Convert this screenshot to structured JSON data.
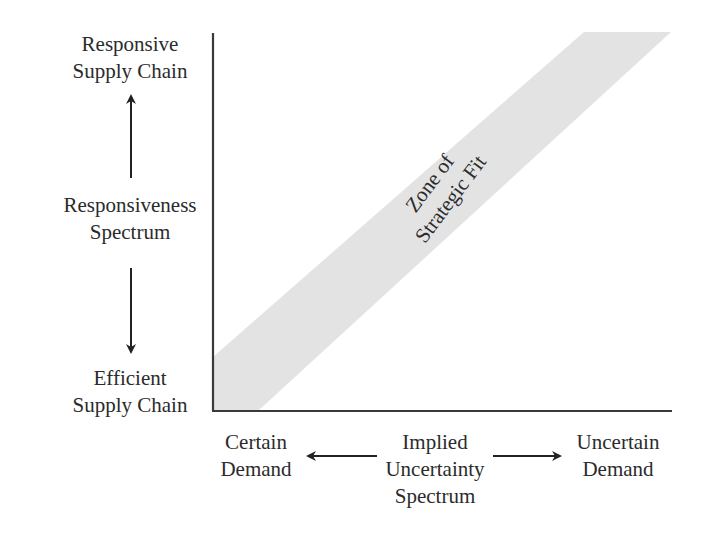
{
  "diagram": {
    "title": "Zone of Strategic Fit",
    "y_axis": {
      "top_label": [
        "Responsive",
        "Supply Chain"
      ],
      "middle_label": [
        "Responsiveness",
        "Spectrum"
      ],
      "bottom_label": [
        "Efficient",
        "Supply Chain"
      ]
    },
    "x_axis": {
      "left_label": [
        "Certain",
        "Demand"
      ],
      "middle_label": [
        "Implied",
        "Uncertainty",
        "Spectrum"
      ],
      "right_label": [
        "Uncertain",
        "Demand"
      ]
    },
    "zone": {
      "label": [
        "Zone of",
        "Strategic Fit"
      ],
      "fill_color": "#e3e3e3"
    },
    "colors": {
      "axis": "#3a3a3a",
      "arrow": "#222222",
      "text": "#2b2b2b"
    }
  }
}
